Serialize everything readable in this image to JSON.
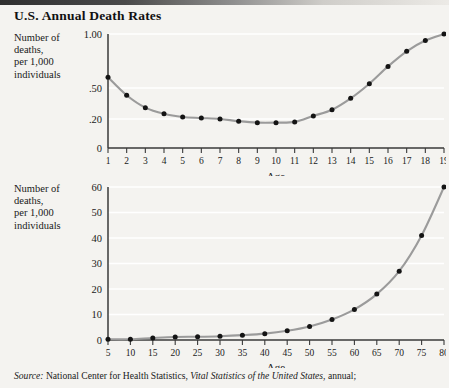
{
  "title": "U.S. Annual Death Rates",
  "colors": {
    "page_background": "#f4f3f0",
    "curve": "#9b9b9b",
    "point": "#141414",
    "axis": "#3a3a3a",
    "gridline": "#ffffff",
    "text": "#1a1a1a"
  },
  "y_axis_block_label": "Number of\ndeaths,\nper 1,000\nindividuals",
  "source": {
    "prefix": "Source:",
    "body_1": " National Center for Health Statistics, ",
    "italic": "Vital Statistics of the United States",
    "body_2": ", annual;"
  },
  "chart_data": [
    {
      "id": "death-rates-ages-1-19",
      "type": "line",
      "title": "",
      "xlabel": "Age",
      "ylabel": "Number of deaths, per 1,000 individuals",
      "x": [
        1,
        2,
        3,
        4,
        5,
        6,
        7,
        8,
        9,
        10,
        11,
        12,
        13,
        14,
        15,
        16,
        17,
        18,
        19
      ],
      "values": [
        0.6,
        0.43,
        0.31,
        0.25,
        0.22,
        0.21,
        0.2,
        0.185,
        0.175,
        0.175,
        0.18,
        0.23,
        0.29,
        0.4,
        0.54,
        0.7,
        0.84,
        0.94,
        1.0
      ],
      "xticklabels": [
        "1",
        "2",
        "3",
        "4",
        "5",
        "6",
        "7",
        "8",
        "9",
        "10",
        "11",
        "12",
        "13",
        "14",
        "15",
        "16",
        "17",
        "18",
        "19"
      ],
      "yticklabels": [
        "1.00",
        ".50",
        ".20",
        "0"
      ],
      "ytickvalues": [
        1.0,
        0.5,
        0.2,
        0
      ],
      "yscale": "nonlinear",
      "ylim": [
        0,
        1.0
      ],
      "xlim": [
        1,
        19
      ],
      "grid": true,
      "legend": "none"
    },
    {
      "id": "death-rates-ages-5-80",
      "type": "line",
      "title": "",
      "xlabel": "Age",
      "ylabel": "Number of deaths, per 1,000 individuals",
      "x": [
        5,
        10,
        15,
        20,
        25,
        30,
        35,
        40,
        45,
        50,
        55,
        60,
        65,
        70,
        75,
        80
      ],
      "values": [
        0.3,
        0.3,
        0.8,
        1.2,
        1.3,
        1.5,
        1.9,
        2.5,
        3.6,
        5.3,
        8.0,
        12.0,
        18.0,
        27.0,
        41.0,
        60.0
      ],
      "xticklabels": [
        "5",
        "10",
        "15",
        "20",
        "25",
        "30",
        "35",
        "40",
        "45",
        "50",
        "55",
        "60",
        "65",
        "70",
        "75",
        "80"
      ],
      "yticklabels": [
        "0",
        "10",
        "20",
        "30",
        "40",
        "50",
        "60"
      ],
      "ytickvalues": [
        0,
        10,
        20,
        30,
        40,
        50,
        60
      ],
      "yscale": "linear",
      "ylim": [
        0,
        60
      ],
      "xlim": [
        5,
        80
      ],
      "grid": true,
      "legend": "none"
    }
  ]
}
